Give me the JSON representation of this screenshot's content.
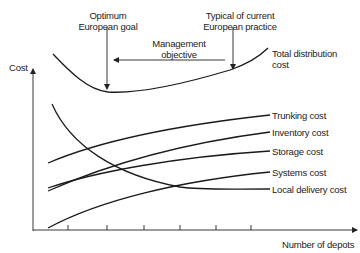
{
  "diagram": {
    "y_axis_label": "Cost",
    "x_axis_label": "Number of depots",
    "annotations": {
      "optimum_line1": "Optimum",
      "optimum_line2": "European goal",
      "typical_line1": "Typical of current",
      "typical_line2": "European practice",
      "management_line1": "Management",
      "management_line2": "objective"
    },
    "curves": [
      {
        "id": "total",
        "label_line1": "Total distribution",
        "label_line2": "cost"
      },
      {
        "id": "trunking",
        "label": "Trunking cost"
      },
      {
        "id": "inventory",
        "label": "Inventory cost"
      },
      {
        "id": "storage",
        "label": "Storage cost"
      },
      {
        "id": "systems",
        "label": "Systems cost"
      },
      {
        "id": "local_delivery",
        "label": "Local delivery cost"
      }
    ],
    "x_ticks": 6,
    "colors": {
      "line": "#1a1a1a",
      "background": "#ffffff"
    }
  }
}
